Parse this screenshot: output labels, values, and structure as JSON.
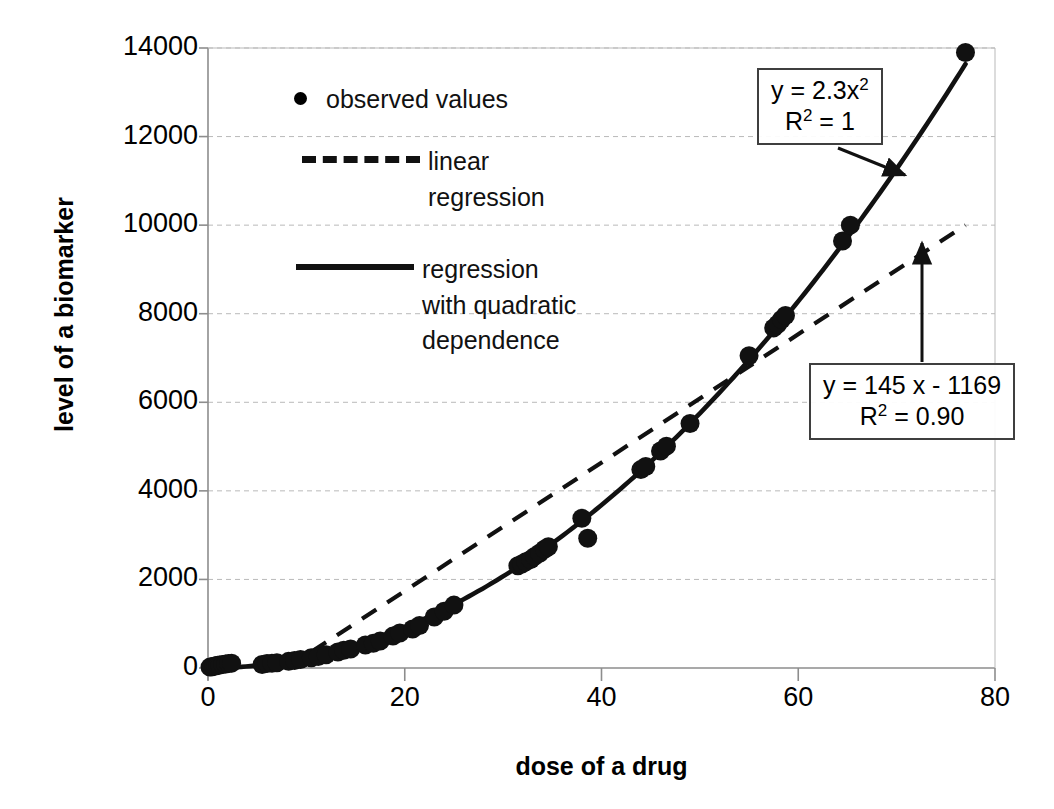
{
  "chart_data": {
    "type": "scatter",
    "title": "",
    "xlabel": "dose of a drug",
    "ylabel": "level of a biomarker",
    "xlim": [
      0,
      80
    ],
    "ylim": [
      0,
      14000
    ],
    "xticks": [
      "0",
      "20",
      "40",
      "60",
      "80"
    ],
    "xtick_values": [
      0,
      20,
      40,
      60,
      80
    ],
    "yticks": [
      "0",
      "2000",
      "4000",
      "6000",
      "8000",
      "10000",
      "12000",
      "14000"
    ],
    "ytick_values": [
      0,
      2000,
      4000,
      6000,
      8000,
      10000,
      12000,
      14000
    ],
    "grid": true,
    "legend_position": "upper-left-inside",
    "series": [
      {
        "name": "observed values",
        "type": "scatter",
        "marker": "filled-circle",
        "color": "#111111",
        "points": [
          [
            0.2,
            20
          ],
          [
            0.4,
            30
          ],
          [
            0.6,
            40
          ],
          [
            0.8,
            50
          ],
          [
            1.0,
            60
          ],
          [
            1.2,
            70
          ],
          [
            1.5,
            80
          ],
          [
            1.8,
            90
          ],
          [
            2.1,
            100
          ],
          [
            2.4,
            110
          ],
          [
            5.5,
            80
          ],
          [
            6.0,
            100
          ],
          [
            6.5,
            110
          ],
          [
            7.0,
            120
          ],
          [
            8.2,
            150
          ],
          [
            8.8,
            170
          ],
          [
            9.4,
            190
          ],
          [
            10.5,
            230
          ],
          [
            11.2,
            260
          ],
          [
            12.0,
            300
          ],
          [
            13.2,
            360
          ],
          [
            13.8,
            400
          ],
          [
            14.5,
            430
          ],
          [
            16.0,
            520
          ],
          [
            16.8,
            560
          ],
          [
            17.5,
            610
          ],
          [
            18.8,
            720
          ],
          [
            19.5,
            790
          ],
          [
            20.8,
            880
          ],
          [
            21.5,
            960
          ],
          [
            23.0,
            1150
          ],
          [
            24.0,
            1280
          ],
          [
            25.0,
            1420
          ],
          [
            31.5,
            2310
          ],
          [
            31.9,
            2350
          ],
          [
            32.3,
            2400
          ],
          [
            32.8,
            2450
          ],
          [
            33.2,
            2520
          ],
          [
            33.7,
            2590
          ],
          [
            34.2,
            2680
          ],
          [
            34.6,
            2740
          ],
          [
            38.0,
            3380
          ],
          [
            38.6,
            2930
          ],
          [
            44.0,
            4480
          ],
          [
            44.5,
            4550
          ],
          [
            46.0,
            4900
          ],
          [
            46.6,
            5010
          ],
          [
            49.0,
            5520
          ],
          [
            55.0,
            7050
          ],
          [
            57.5,
            7680
          ],
          [
            57.9,
            7760
          ],
          [
            58.3,
            7870
          ],
          [
            58.7,
            7960
          ],
          [
            64.5,
            9640
          ],
          [
            65.3,
            10000
          ],
          [
            77.0,
            13900
          ]
        ]
      },
      {
        "name": "linear regression",
        "type": "line",
        "style": "dashed",
        "color": "#111111",
        "equation": "y = 145 x - 1169",
        "r_squared": "0.90",
        "endpoints": [
          [
            8.0,
            0
          ],
          [
            77.0,
            10000
          ]
        ]
      },
      {
        "name": "regression with quadratic dependence",
        "type": "line",
        "style": "solid",
        "color": "#111111",
        "equation": "y = 2.3x²",
        "r_squared": "1",
        "coefficient": 2.3
      }
    ]
  },
  "axes": {
    "x_title": "dose of a drug",
    "y_title": "level of a biomarker",
    "x_tick_labels": [
      "0",
      "20",
      "40",
      "60",
      "80"
    ],
    "y_tick_labels": [
      "0",
      "2000",
      "4000",
      "6000",
      "8000",
      "10000",
      "12000",
      "14000"
    ]
  },
  "legend": {
    "items": [
      {
        "key": "dot",
        "label": "observed values"
      },
      {
        "key": "dashed-line",
        "label": "linear\nregression"
      },
      {
        "key": "solid-line",
        "label": "regression\nwith quadratic\ndependence"
      }
    ]
  },
  "annotations": {
    "quadratic": {
      "line1_prefix": "y = 2.3x",
      "line1_sup": "2",
      "line2_prefix": "R",
      "line2_sup": "2",
      "line2_suffix": " = 1",
      "full_text": "y = 2.3x2  R2 = 1"
    },
    "linear": {
      "line1": "y = 145 x - 1169",
      "line2_prefix": "R",
      "line2_sup": "2",
      "line2_suffix": " = 0.90",
      "full_text": "y = 145 x - 1169  R2 = 0.90"
    }
  },
  "colors": {
    "ink": "#111111",
    "grid": "#b9b9b9",
    "axis": "#8d8d8d",
    "box_border": "#3f3f3f",
    "background": "#ffffff"
  }
}
